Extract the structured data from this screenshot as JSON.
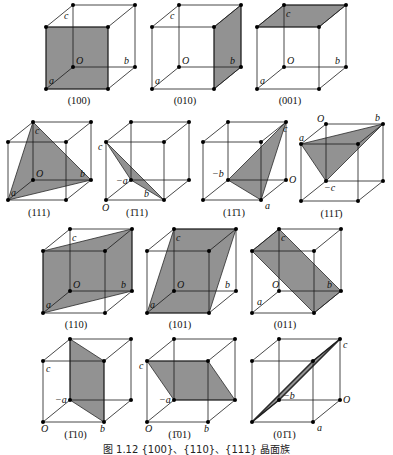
{
  "figure": {
    "caption": "图 1.12 {100}、{110}、{111} 晶面族",
    "shade_color": "#8c8c8c",
    "edge_color": "#1a1a1a"
  },
  "cubes": [
    {
      "id": "100",
      "label": "(100)",
      "x": 46,
      "y": 89,
      "s": 62,
      "dx": 27,
      "dy": -22,
      "face": [
        "F000",
        "F100",
        "F101",
        "F001"
      ],
      "faceKind": "front",
      "labels": [
        {
          "t": "c",
          "v": "B001",
          "ox": -9,
          "oy": 14
        },
        {
          "t": "O",
          "v": "B000",
          "ox": 3,
          "oy": -3
        },
        {
          "t": "b",
          "v": "B100",
          "ox": -11,
          "oy": -3
        },
        {
          "t": "a",
          "v": "F000",
          "ox": 3,
          "oy": -5
        }
      ],
      "ly": 104
    },
    {
      "id": "010",
      "label": "(010)",
      "x": 152,
      "y": 89,
      "s": 62,
      "dx": 27,
      "dy": -22,
      "face": [
        "F100",
        "B100",
        "B101",
        "F101"
      ],
      "labels": [
        {
          "t": "c",
          "v": "B001",
          "ox": -9,
          "oy": 14
        },
        {
          "t": "O",
          "v": "B000",
          "ox": 3,
          "oy": -3
        },
        {
          "t": "b",
          "v": "B100",
          "ox": -11,
          "oy": -3
        },
        {
          "t": "a",
          "v": "F000",
          "ox": 3,
          "oy": -5
        }
      ],
      "ly": 104
    },
    {
      "id": "001",
      "label": "(001)",
      "x": 257,
      "y": 89,
      "s": 62,
      "dx": 27,
      "dy": -22,
      "face": [
        "F001",
        "F101",
        "B101",
        "B001"
      ],
      "labels": [
        {
          "t": "c",
          "v": "B001",
          "ox": 2,
          "oy": 12
        },
        {
          "t": "O",
          "v": "B000",
          "ox": 3,
          "oy": -3
        },
        {
          "t": "b",
          "v": "B100",
          "ox": -11,
          "oy": -3
        },
        {
          "t": "a",
          "v": "F000",
          "ox": 3,
          "oy": -5
        }
      ],
      "ly": 104
    },
    {
      "id": "111",
      "label": "(111)",
      "x": 8,
      "y": 200,
      "s": 58,
      "dx": 25,
      "dy": -20,
      "face": [
        "F000",
        "B100",
        "B001"
      ],
      "labels": [
        {
          "t": "c",
          "v": "B001",
          "ox": 2,
          "oy": 12
        },
        {
          "t": "O",
          "v": "B000",
          "ox": 3,
          "oy": -3
        },
        {
          "t": "b",
          "v": "B100",
          "ox": -11,
          "oy": -3
        },
        {
          "t": "a",
          "v": "F000",
          "ox": 3,
          "oy": -4
        }
      ],
      "ly": 216
    },
    {
      "id": "-111",
      "label": "(1̄11)",
      "x": 106,
      "y": 200,
      "s": 58,
      "dx": 25,
      "dy": -20,
      "face": [
        "F001",
        "B000",
        "F100"
      ],
      "labels": [
        {
          "t": "c",
          "v": "F001",
          "ox": -8,
          "oy": 8
        },
        {
          "t": "−a",
          "v": "B000",
          "ox": -15,
          "oy": 4
        },
        {
          "t": "b",
          "v": "F100",
          "ox": -20,
          "oy": -3
        },
        {
          "t": "O",
          "v": "F000",
          "ox": -4,
          "oy": 11
        }
      ],
      "ly": 216
    },
    {
      "id": "1-11",
      "label": "(11̄1)",
      "x": 203,
      "y": 200,
      "s": 58,
      "dx": 25,
      "dy": -20,
      "face": [
        "B000",
        "F100",
        "B101"
      ],
      "labels": [
        {
          "t": "c",
          "v": "B101",
          "ox": -3,
          "oy": 10
        },
        {
          "t": "−b",
          "v": "B000",
          "ox": -16,
          "oy": -3
        },
        {
          "t": "O",
          "v": "B100",
          "ox": 3,
          "oy": 3
        },
        {
          "t": "a",
          "v": "F100",
          "ox": 4,
          "oy": 9
        }
      ],
      "ly": 216
    },
    {
      "id": "11-1",
      "label": "(111̄)",
      "x": 301,
      "y": 201,
      "s": 57,
      "dx": 25,
      "dy": -20,
      "face": [
        "F001",
        "B101",
        "B000"
      ],
      "labels": [
        {
          "t": "a",
          "v": "F001",
          "ox": -2,
          "oy": -3
        },
        {
          "t": "O",
          "v": "B001",
          "ox": -9,
          "oy": -2
        },
        {
          "t": "b",
          "v": "B101",
          "ox": -8,
          "oy": -3
        },
        {
          "t": "−c",
          "v": "B000",
          "ox": -2,
          "oy": 10
        },
        {
          "t": "O",
          "v": "F000",
          "ox": -8,
          "oy": -22,
          "hide": true
        }
      ],
      "ly": 217
    },
    {
      "id": "110",
      "label": "(110)",
      "x": 43,
      "y": 313,
      "s": 62,
      "dx": 27,
      "dy": -22,
      "face": [
        "F000",
        "B100",
        "B101",
        "F001"
      ],
      "labels": [
        {
          "t": "c",
          "v": "B001",
          "ox": 2,
          "oy": 12
        },
        {
          "t": "O",
          "v": "B000",
          "ox": 3,
          "oy": -3
        },
        {
          "t": "b",
          "v": "B100",
          "ox": -11,
          "oy": -3
        },
        {
          "t": "a",
          "v": "F000",
          "ox": 3,
          "oy": -5
        }
      ],
      "ly": 328
    },
    {
      "id": "101",
      "label": "(101)",
      "x": 147,
      "y": 313,
      "s": 62,
      "dx": 27,
      "dy": -22,
      "face": [
        "F000",
        "F100",
        "B101",
        "B001"
      ],
      "labels": [
        {
          "t": "c",
          "v": "B001",
          "ox": 2,
          "oy": 12
        },
        {
          "t": "O",
          "v": "B000",
          "ox": 3,
          "oy": -3
        },
        {
          "t": "b",
          "v": "B100",
          "ox": -11,
          "oy": -3
        },
        {
          "t": "a",
          "v": "F000",
          "ox": 3,
          "oy": -5
        }
      ],
      "ly": 328
    },
    {
      "id": "011",
      "label": "(011)",
      "x": 252,
      "y": 313,
      "s": 62,
      "dx": 27,
      "dy": -22,
      "face": [
        "F001",
        "B001",
        "B100",
        "F100"
      ],
      "labels": [
        {
          "t": "c",
          "v": "B001",
          "ox": 2,
          "oy": 12
        },
        {
          "t": "O",
          "v": "B000",
          "ox": -7,
          "oy": -3
        },
        {
          "t": "b",
          "v": "B100",
          "ox": -14,
          "oy": -3
        },
        {
          "t": "a",
          "v": "F000",
          "ox": 5,
          "oy": -8
        }
      ],
      "ly": 328
    },
    {
      "id": "-110",
      "label": "(1̄10)",
      "x": 43,
      "y": 422,
      "s": 61,
      "dx": 27,
      "dy": -22,
      "face": [
        "B001",
        "F101",
        "F100",
        "B000"
      ],
      "labels": [
        {
          "t": "c",
          "v": "F001",
          "ox": 3,
          "oy": 11
        },
        {
          "t": "−a",
          "v": "B000",
          "ox": -15,
          "oy": 3
        },
        {
          "t": "b",
          "v": "F100",
          "ox": -4,
          "oy": 10
        },
        {
          "t": "O",
          "v": "F000",
          "ox": -2,
          "oy": 10
        }
      ],
      "ly": 438
    },
    {
      "id": "-101",
      "label": "(1̄01)",
      "x": 147,
      "y": 422,
      "s": 61,
      "dx": 27,
      "dy": -22,
      "face": [
        "F001",
        "F101",
        "B100",
        "B000"
      ],
      "labels": [
        {
          "t": "c",
          "v": "F001",
          "ox": -8,
          "oy": 8
        },
        {
          "t": "−a",
          "v": "B000",
          "ox": -15,
          "oy": 3
        },
        {
          "t": "b",
          "v": "F100",
          "ox": -4,
          "oy": 10
        },
        {
          "t": "O",
          "v": "F000",
          "ox": -2,
          "oy": 10
        }
      ],
      "ly": 438
    },
    {
      "id": "0-11",
      "label": "(01̄1)",
      "x": 252,
      "y": 422,
      "s": 61,
      "dx": 27,
      "dy": -22,
      "face": [
        "F000",
        "B000",
        "B101",
        "F101"
      ],
      "thin": true,
      "labels": [
        {
          "t": "c",
          "v": "B101",
          "ox": 3,
          "oy": 9
        },
        {
          "t": "−b",
          "v": "B000",
          "ox": 4,
          "oy": -1
        },
        {
          "t": "O",
          "v": "B100",
          "ox": 3,
          "oy": 3
        },
        {
          "t": "a",
          "v": "F100",
          "ox": 4,
          "oy": 9
        }
      ],
      "ly": 438
    }
  ]
}
